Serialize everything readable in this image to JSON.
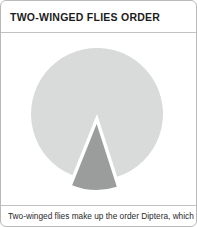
{
  "card": {
    "title": "TWO-WINGED FLIES ORDER",
    "caption": "Two-winged flies make up the order Diptera, which",
    "border_color": "#b9b9b9",
    "divider_color": "#c2c2c2",
    "background": "#ffffff",
    "title_color": "#1c1c1c",
    "caption_color": "#2a2a2a"
  },
  "chart_data": {
    "type": "pie",
    "title": "TWO-WINGED FLIES ORDER",
    "categories": [
      "Other insect orders",
      "Diptera"
    ],
    "values": [
      89,
      11
    ],
    "colors": [
      "#d9dada",
      "#9b9c9c"
    ],
    "exploded": [
      false,
      true
    ],
    "explode_offset": 10,
    "start_angle_deg": 0,
    "direction": "clockwise",
    "legend": "none",
    "labels_shown": false,
    "center": {
      "cx": 96,
      "cy": 81
    },
    "radius": 66,
    "xlabel": "",
    "ylabel": ""
  }
}
